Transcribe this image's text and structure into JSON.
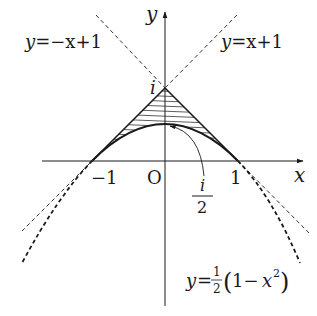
{
  "diagram": {
    "type": "function-graph",
    "axes": {
      "x_label": "x",
      "y_label": "y",
      "origin_label": "O",
      "tick_labels": {
        "neg_one": "−1",
        "pos_one": "1"
      }
    },
    "curves": [
      {
        "id": "line-neg",
        "equation": "y=−x+1",
        "lhs": "y",
        "rhs": "=−x+1",
        "style": "dashed"
      },
      {
        "id": "line-pos",
        "equation": "y=x+1",
        "lhs": "y",
        "rhs": "=x+1",
        "style": "dashed"
      },
      {
        "id": "parabola",
        "equation": "y=1/2(1−x^2)",
        "lhs": "y",
        "eq": "=",
        "frac_num": "1",
        "frac_den": "2",
        "paren_open": "(",
        "body": "1−",
        "var": "x",
        "exp": "2",
        "paren_close": ")",
        "style": "solid-then-dashed"
      }
    ],
    "annotations": {
      "apex_label": "i",
      "vertex_label_num": "i",
      "vertex_label_den": "2"
    },
    "shaded_region": "between |x|+... lines and parabola for −1 ≤ x ≤ 1, hatched",
    "colors": {
      "ink": "#1a1a1a",
      "hatch": "#333333",
      "background": "#ffffff"
    }
  }
}
